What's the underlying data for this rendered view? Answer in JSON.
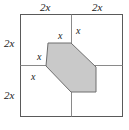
{
  "figure": {
    "type": "geometry-diagram",
    "colors": {
      "outer_border": "#5a5a5a",
      "grid_line": "#8a8a8a",
      "shape_stroke": "#6e6e6e",
      "shape_fill": "#c9c9c9",
      "background": "#ffffff",
      "label_text": "#1a1a1a"
    },
    "outer_square": {
      "name": "outer-square",
      "side_label": "4x",
      "left": 20,
      "top": 14,
      "width": 102,
      "height": 102
    },
    "grid": {
      "vertical_midline_x": 71,
      "horizontal_midline_y": 65
    },
    "shaded_polygon": {
      "name": "shaded-hexagon",
      "sides": 6,
      "points": "48,43 71,43 96,67 96,92 71,92 46,66"
    },
    "labels": {
      "top_left": "2x",
      "top_right": "2x",
      "left_upper": "2x",
      "left_lower": "2x",
      "hex_top": "x",
      "hex_upper_right": "x",
      "hex_left": "x",
      "hex_lower_left": "x"
    },
    "label_positions": {
      "top_left": {
        "x": 40,
        "y": 2
      },
      "top_right": {
        "x": 92,
        "y": 2
      },
      "left_upper": {
        "x": 4,
        "y": 38
      },
      "left_lower": {
        "x": 4,
        "y": 90
      },
      "hex_top": {
        "x": 58,
        "y": 31
      },
      "hex_upper_right": {
        "x": 76,
        "y": 26
      },
      "hex_left": {
        "x": 37,
        "y": 52
      },
      "hex_lower_left": {
        "x": 31,
        "y": 72
      }
    }
  }
}
